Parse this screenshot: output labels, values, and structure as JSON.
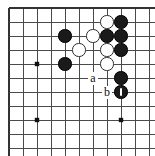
{
  "diagram": {
    "kind": "go-board-problem-diagram",
    "board": {
      "image_width": 155,
      "image_height": 156,
      "origin_x": 9,
      "origin_y": 8,
      "spacing": 14,
      "cols": 11,
      "rows": 11,
      "line_color": "#4a4a4a",
      "edge_color": "#333333",
      "background_color": "#ffffff",
      "is_corner_view": true,
      "top_edge_visible": true,
      "left_edge_visible": true
    },
    "star_points": [
      {
        "col": 2,
        "row": 4
      },
      {
        "col": 2,
        "row": 8
      },
      {
        "col": 8,
        "row": 8
      }
    ],
    "stones": [
      {
        "color": "black",
        "col": 4,
        "row": 2,
        "label": ""
      },
      {
        "color": "black",
        "col": 4,
        "row": 4,
        "label": ""
      },
      {
        "color": "white",
        "col": 7,
        "row": 1,
        "label": ""
      },
      {
        "color": "black",
        "col": 8,
        "row": 1,
        "label": ""
      },
      {
        "color": "white",
        "col": 6,
        "row": 2,
        "label": ""
      },
      {
        "color": "black",
        "col": 7,
        "row": 2,
        "label": ""
      },
      {
        "color": "black",
        "col": 8,
        "row": 2,
        "label": ""
      },
      {
        "color": "white",
        "col": 5,
        "row": 3,
        "label": ""
      },
      {
        "color": "white",
        "col": 7,
        "row": 3,
        "label": ""
      },
      {
        "color": "black",
        "col": 8,
        "row": 3,
        "label": ""
      },
      {
        "color": "white",
        "col": 7,
        "row": 4,
        "label": ""
      },
      {
        "color": "black",
        "col": 8,
        "row": 5,
        "label": ""
      },
      {
        "color": "black",
        "col": 8,
        "row": 6,
        "label": "",
        "marked": true
      }
    ],
    "point_labels": [
      {
        "text": "a",
        "col": 6,
        "row": 5
      },
      {
        "text": "b",
        "col": 7,
        "row": 6
      }
    ],
    "colors": {
      "black_stone": "#1a1a1a",
      "white_stone": "#ffffff",
      "white_stone_border": "#2b2b2b",
      "grid": "#4a4a4a",
      "mark": "#ffffff",
      "label_text": "#111111"
    }
  }
}
